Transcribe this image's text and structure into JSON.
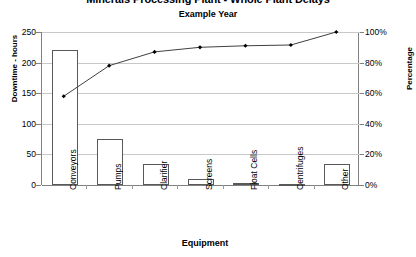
{
  "chart_data": {
    "type": "bar",
    "title": "Minerals Processing Plant - Whole Plant Delays",
    "subtitle": "Example Year",
    "xlabel": "Equipment",
    "ylabel": "Downtime - hours",
    "y2label": "Percentage",
    "categories": [
      "Conveyors",
      "Pumps",
      "Clarifier",
      "Screens",
      "Float Cells",
      "Centrifuges",
      "Other"
    ],
    "values": [
      220,
      75,
      35,
      10,
      3,
      2,
      35
    ],
    "ylim": [
      0,
      250
    ],
    "y2lim": [
      0,
      100
    ],
    "yticks": [
      "0",
      "50",
      "100",
      "150",
      "200",
      "250"
    ],
    "ytick_values": [
      0,
      50,
      100,
      150,
      200,
      250
    ],
    "y2ticks": [
      "0%",
      "20%",
      "40%",
      "60%",
      "80%",
      "100%"
    ],
    "y2tick_values": [
      0,
      20,
      40,
      60,
      80,
      100
    ],
    "grid": true,
    "legend": "none",
    "series": [
      {
        "name": "Downtime - hours",
        "type": "bar",
        "axis": "left",
        "values": [
          220,
          75,
          35,
          10,
          3,
          2,
          35
        ]
      },
      {
        "name": "Cumulative Percentage",
        "type": "line",
        "axis": "right",
        "values": [
          58,
          78,
          87,
          90,
          91,
          91.5,
          100
        ]
      }
    ],
    "bar_color": "#ffffff",
    "bar_edge_color": "#595959",
    "line_color": "#404040",
    "marker_color": "#000000",
    "grid_color": "#c8c8c8",
    "axis_color": "#808080"
  }
}
